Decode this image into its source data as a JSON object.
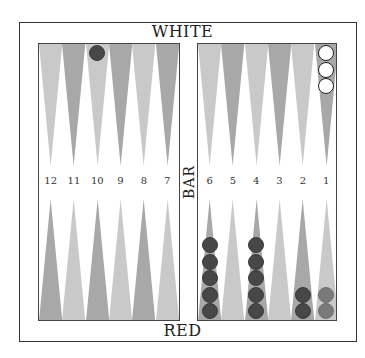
{
  "players": {
    "top": "WHITE",
    "bottom": "RED"
  },
  "bar_label": "BAR",
  "colors": {
    "light_point": "#c9c9c9",
    "dark_point": "#a8a8a8",
    "red_checker": "#474747",
    "red_checker_ghost": "#7a7a7a",
    "white_checker": "#ffffff"
  },
  "bottom_labels": [
    "12",
    "11",
    "10",
    "9",
    "8",
    "7",
    "6",
    "5",
    "4",
    "3",
    "2",
    "1"
  ],
  "top_points": [
    {
      "point": 13,
      "shade": "light"
    },
    {
      "point": 14,
      "shade": "dark"
    },
    {
      "point": 15,
      "shade": "light"
    },
    {
      "point": 16,
      "shade": "dark"
    },
    {
      "point": 17,
      "shade": "light"
    },
    {
      "point": 18,
      "shade": "dark"
    },
    {
      "point": 19,
      "shade": "light"
    },
    {
      "point": 20,
      "shade": "dark"
    },
    {
      "point": 21,
      "shade": "light"
    },
    {
      "point": 22,
      "shade": "dark"
    },
    {
      "point": 23,
      "shade": "light"
    },
    {
      "point": 24,
      "shade": "dark"
    }
  ],
  "bottom_points": [
    {
      "point": 12,
      "shade": "dark"
    },
    {
      "point": 11,
      "shade": "light"
    },
    {
      "point": 10,
      "shade": "dark"
    },
    {
      "point": 9,
      "shade": "light"
    },
    {
      "point": 8,
      "shade": "dark"
    },
    {
      "point": 7,
      "shade": "light"
    },
    {
      "point": 6,
      "shade": "dark"
    },
    {
      "point": 5,
      "shade": "light"
    },
    {
      "point": 4,
      "shade": "dark"
    },
    {
      "point": 3,
      "shade": "light"
    },
    {
      "point": 2,
      "shade": "dark"
    },
    {
      "point": 1,
      "shade": "light"
    }
  ],
  "checkers": [
    {
      "point": 15,
      "color": "red",
      "count": 1
    },
    {
      "point": 24,
      "color": "white",
      "count": 3
    },
    {
      "point": 6,
      "color": "red",
      "count": 5
    },
    {
      "point": 4,
      "color": "red",
      "count": 5
    },
    {
      "point": 2,
      "color": "red",
      "count": 2
    },
    {
      "point": 1,
      "color": "red",
      "count": 2,
      "ghost": true
    }
  ]
}
